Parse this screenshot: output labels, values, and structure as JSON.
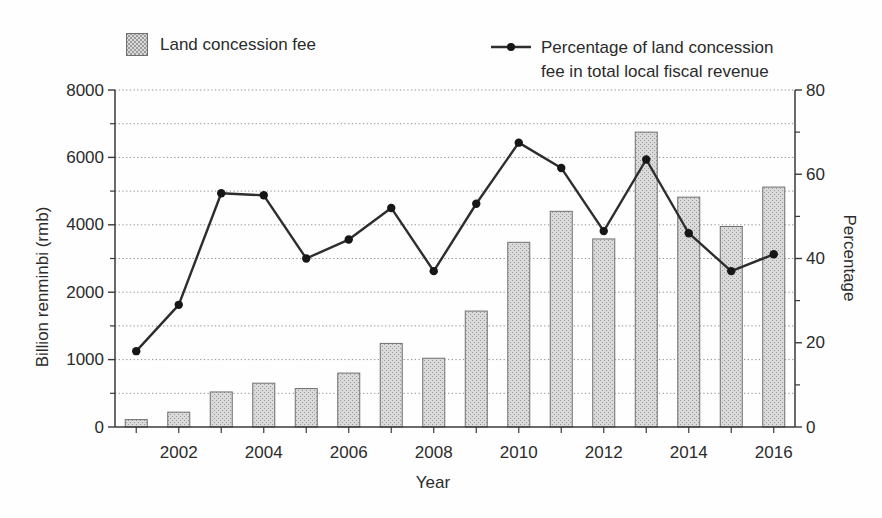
{
  "chart_data": {
    "type": "bar",
    "subtype": "combo-bar-line-dual-axis",
    "title": "",
    "xlabel": "Year",
    "ylabel_left": "Billion renminbi (rmb)",
    "ylabel_right": "Percentage",
    "categories": [
      "2001",
      "2002",
      "2003",
      "2004",
      "2005",
      "2006",
      "2007",
      "2008",
      "2009",
      "2010",
      "2011",
      "2012",
      "2013",
      "2014",
      "2015",
      "2016"
    ],
    "x_labeled_ticks": [
      "2002",
      "2004",
      "2006",
      "2008",
      "2010",
      "2012",
      "2014",
      "2016"
    ],
    "series": [
      {
        "name": "Land concession fee",
        "type": "bar",
        "axis": "left",
        "unit": "billion rmb",
        "values": [
          110,
          220,
          520,
          650,
          570,
          800,
          1240,
          1020,
          1720,
          3480,
          4400,
          3580,
          6750,
          4820,
          3950,
          5120
        ]
      },
      {
        "name": "Percentage of land concession fee in total local fiscal revenue",
        "type": "line",
        "axis": "right",
        "unit": "%",
        "values": [
          18,
          29,
          55.5,
          55,
          40,
          44.5,
          52,
          37,
          53,
          67.5,
          61.5,
          46.5,
          63.5,
          46,
          37,
          41
        ]
      }
    ],
    "y_left": {
      "ticks": [
        8000,
        6000,
        4000,
        2000,
        1000,
        0
      ],
      "scale_note": "labeled ticks equally spaced (non-linear below 2000)"
    },
    "y_right": {
      "ticks": [
        80,
        60,
        40,
        20,
        0
      ],
      "range": [
        0,
        80
      ]
    },
    "grid": "horizontal dotted, minor + major levels",
    "legend": {
      "position": "top",
      "bar_label": "Land concession fee",
      "line_label": "Percentage of land concession fee in total local fiscal revenue",
      "line_label_lines": [
        "Percentage of land concession",
        "fee in total local fiscal revenue"
      ]
    },
    "colors": {
      "background": "#fefefe",
      "bar_fill": "#dadada",
      "bar_dot": "#9a9a9a",
      "bar_border": "#6f6f6f",
      "line": "#2d2d2d",
      "marker": "#161616",
      "grid": "#909090",
      "axis": "#3a3a3a",
      "text": "#2b2b2b"
    }
  }
}
